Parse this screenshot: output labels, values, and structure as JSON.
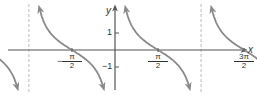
{
  "chart_data": {
    "type": "line",
    "title": "",
    "function": "y = cot x",
    "xlabel": "x",
    "ylabel": "y",
    "x_ticks": [
      {
        "sign": "−",
        "num": "3π",
        "den": "2",
        "value": -4.712
      },
      {
        "sign": "−",
        "num": "π",
        "den": "2",
        "value": -1.571
      },
      {
        "sign": "",
        "num": "π",
        "den": "2",
        "value": 1.571
      },
      {
        "sign": "",
        "num": "3π",
        "den": "2",
        "value": 4.712
      },
      {
        "sign": "",
        "num": "5π",
        "den": "2",
        "value": 7.854
      }
    ],
    "y_ticks": [
      {
        "label": "1",
        "value": 1
      },
      {
        "label": "−1",
        "value": -1
      }
    ],
    "asymptotes": [
      -6.283,
      -3.142,
      0,
      3.142,
      6.283
    ],
    "zeros": [
      -4.712,
      -1.571,
      1.571,
      4.712,
      7.854
    ],
    "xlim": [
      -7.1,
      8.9
    ],
    "ylim": [
      -2.3,
      2.6
    ],
    "grid": false,
    "colors": {
      "curve": "#8a8a8a",
      "axis": "#555555",
      "asymptote": "#bbbbbb"
    }
  }
}
